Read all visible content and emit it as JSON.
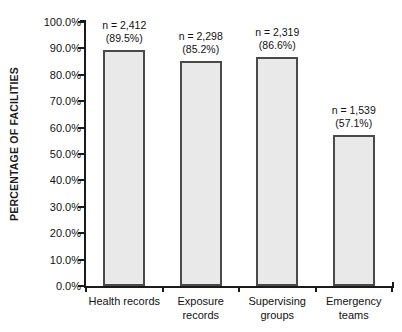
{
  "chart_data": {
    "type": "bar",
    "title": "",
    "subtitle": "",
    "xlabel": "",
    "ylabel": "PERCENTAGE OF FACILITIES",
    "ylim": [
      0,
      100
    ],
    "grid": false,
    "legend": "none",
    "categories": [
      "Health records",
      "Exposure records",
      "Supervising groups",
      "Emergency teams"
    ],
    "values": [
      89.5,
      85.2,
      86.6,
      57.1
    ],
    "counts": [
      2412,
      2298,
      2319,
      1539
    ],
    "ytick_labels": [
      "0.0%",
      "10.0%",
      "20.0%",
      "30.0%",
      "40.0%",
      "50.0%",
      "60.0%",
      "70.0%",
      "80.0%",
      "90.0%",
      "100.0%"
    ],
    "ytick_values": [
      0,
      10,
      20,
      30,
      40,
      50,
      60,
      70,
      80,
      90,
      100
    ],
    "annotations": [
      {
        "count_label": "n = 2,412",
        "percent_label": "(89.5%)"
      },
      {
        "count_label": "n = 2,298",
        "percent_label": "(85.2%)"
      },
      {
        "count_label": "n = 2,319",
        "percent_label": "(86.6%)"
      },
      {
        "count_label": "n = 1,539",
        "percent_label": "(57.1%)"
      }
    ],
    "category_label_lines": [
      [
        "Health records"
      ],
      [
        "Exposure",
        "records"
      ],
      [
        "Supervising",
        "groups"
      ],
      [
        "Emergency",
        "teams"
      ]
    ],
    "colors": {
      "bar_fill": "#e9e9e9",
      "bar_border": "#4a4a4a",
      "axis": "#1a1a1a",
      "text": "#111111",
      "background": "#ffffff"
    }
  }
}
